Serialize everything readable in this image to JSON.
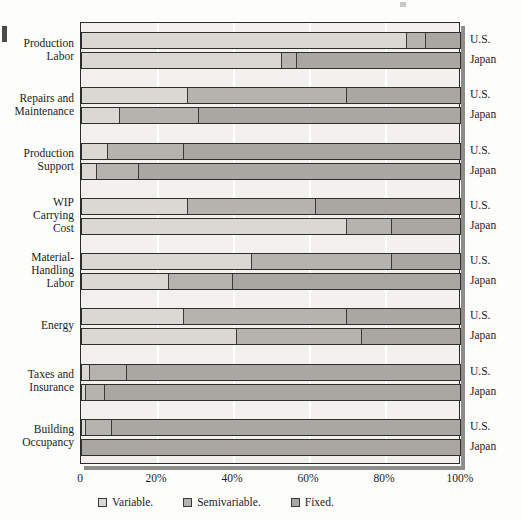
{
  "chart_data": {
    "type": "bar",
    "orientation": "horizontal",
    "stacked": true,
    "percent_stacked": true,
    "title": "",
    "subtitle": "",
    "xlabel": "",
    "ylabel": "",
    "xlim": [
      0,
      100
    ],
    "xtick_labels": [
      "0",
      "20%",
      "40%",
      "60%",
      "80%",
      "100%"
    ],
    "xtick_values": [
      0,
      20,
      40,
      60,
      80,
      100
    ],
    "grid": "vertical",
    "legend_position": "bottom-left",
    "legend": [
      {
        "label": "Variable.",
        "color": "#d9d8d3",
        "key": "variable"
      },
      {
        "label": "Semivariable.",
        "color": "#b4b3ae",
        "key": "semivariable"
      },
      {
        "label": "Fixed.",
        "color": "#a8a7a2",
        "key": "fixed"
      }
    ],
    "series_names": [
      "U.S.",
      "Japan"
    ],
    "categories": [
      "Production Labor",
      "Repairs and Maintenance",
      "Production Support",
      "WIP Carrying Cost",
      "Material-Handling Labor",
      "Energy",
      "Taxes and Insurance",
      "Building Occupancy"
    ],
    "groups": [
      {
        "category_lines": [
          "Production",
          "Labor"
        ],
        "rows": [
          {
            "series": "U.S.",
            "variable": 86,
            "semivariable": 5,
            "fixed": 9
          },
          {
            "series": "Japan",
            "variable": 53,
            "semivariable": 4,
            "fixed": 43
          }
        ]
      },
      {
        "category_lines": [
          "Repairs and",
          "Maintenance"
        ],
        "rows": [
          {
            "series": "U.S.",
            "variable": 28,
            "semivariable": 42,
            "fixed": 30
          },
          {
            "series": "Japan",
            "variable": 10,
            "semivariable": 21,
            "fixed": 69
          }
        ]
      },
      {
        "category_lines": [
          "Production",
          "Support"
        ],
        "rows": [
          {
            "series": "U.S.",
            "variable": 7,
            "semivariable": 20,
            "fixed": 73
          },
          {
            "series": "Japan",
            "variable": 4,
            "semivariable": 11,
            "fixed": 85
          }
        ]
      },
      {
        "category_lines": [
          "WIP",
          "Carrying",
          "Cost"
        ],
        "rows": [
          {
            "series": "U.S.",
            "variable": 28,
            "semivariable": 34,
            "fixed": 38
          },
          {
            "series": "Japan",
            "variable": 70,
            "semivariable": 12,
            "fixed": 18
          }
        ]
      },
      {
        "category_lines": [
          "Material-",
          "Handling",
          "Labor"
        ],
        "rows": [
          {
            "series": "U.S.",
            "variable": 45,
            "semivariable": 37,
            "fixed": 18
          },
          {
            "series": "Japan",
            "variable": 23,
            "semivariable": 17,
            "fixed": 60
          }
        ]
      },
      {
        "category_lines": [
          "Energy"
        ],
        "rows": [
          {
            "series": "U.S.",
            "variable": 27,
            "semivariable": 43,
            "fixed": 30
          },
          {
            "series": "Japan",
            "variable": 41,
            "semivariable": 33,
            "fixed": 26
          }
        ]
      },
      {
        "category_lines": [
          "Taxes and",
          "Insurance"
        ],
        "rows": [
          {
            "series": "U.S.",
            "variable": 2,
            "semivariable": 10,
            "fixed": 88
          },
          {
            "series": "Japan",
            "variable": 1,
            "semivariable": 5,
            "fixed": 94
          }
        ]
      },
      {
        "category_lines": [
          "Building",
          "Occupancy"
        ],
        "rows": [
          {
            "series": "U.S.",
            "variable": 1,
            "semivariable": 7,
            "fixed": 92
          },
          {
            "series": "Japan",
            "variable": 0,
            "semivariable": 0,
            "fixed": 100
          }
        ]
      }
    ]
  },
  "colors": {
    "variable": "#d9d8d3",
    "semivariable": "#b4b3ae",
    "fixed": "#a8a7a2",
    "plot_background": "#f2f1ee",
    "frame": "#2b2b2b",
    "gridline": "#ffffff",
    "text": "#1c1c1c"
  }
}
